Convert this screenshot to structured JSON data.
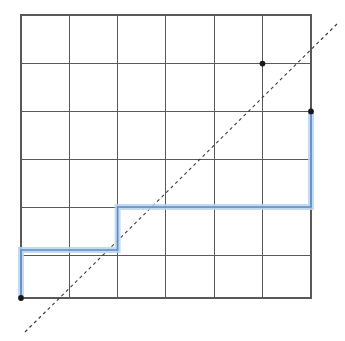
{
  "figure": {
    "type": "diagram",
    "width": 345,
    "height": 341,
    "background_color": "#ffffff"
  },
  "grid": {
    "label": "grid",
    "line_color": "#595959",
    "border_color": "#595959",
    "columns": 6,
    "rows": 6,
    "x_lines": [
      21,
      69.3,
      117.6,
      165.9,
      214.2,
      262.5,
      311
    ],
    "y_lines": [
      15,
      63,
      111,
      159,
      207,
      255,
      298
    ],
    "left": 21,
    "top": 15,
    "right": 311,
    "bottom": 298,
    "cell_width": 48.3,
    "cell_height": 48
  },
  "lattice_path": {
    "label": "staircase lattice path",
    "glow_color": "#b9d4ee",
    "stroke_color": "#5b8dc8",
    "start_point": [
      21,
      298
    ],
    "end_point": [
      311,
      111
    ],
    "points": [
      [
        21,
        298
      ],
      [
        21,
        250
      ],
      [
        117.6,
        250
      ],
      [
        117.6,
        207
      ],
      [
        311,
        207
      ],
      [
        311,
        111
      ]
    ],
    "segments": [
      {
        "name": "up-1",
        "from": [
          21,
          298
        ],
        "to": [
          21,
          250
        ],
        "direction": "up"
      },
      {
        "name": "right-1",
        "from": [
          21,
          250
        ],
        "to": [
          117.6,
          250
        ],
        "direction": "right"
      },
      {
        "name": "up-2",
        "from": [
          117.6,
          250
        ],
        "to": [
          117.6,
          207
        ],
        "direction": "up"
      },
      {
        "name": "right-2",
        "from": [
          117.6,
          207
        ],
        "to": [
          311,
          207
        ],
        "direction": "right"
      },
      {
        "name": "up-3",
        "from": [
          311,
          207
        ],
        "to": [
          311,
          111
        ],
        "direction": "up"
      }
    ]
  },
  "diagonal": {
    "label": "dashed diagonal reference line",
    "color": "#3a3a3a",
    "dash_pattern": "3.2 3.2",
    "from": [
      25,
      332
    ],
    "to": [
      339,
      22
    ]
  },
  "dots": [
    {
      "name": "dot-upper",
      "cx": 262.5,
      "cy": 63.6,
      "r": 2.9,
      "color": "#1a1a1a"
    },
    {
      "name": "dot-right",
      "cx": 311,
      "cy": 111.4,
      "r": 2.9,
      "color": "#1a1a1a"
    },
    {
      "name": "dot-origin",
      "cx": 21,
      "cy": 298,
      "r": 2.9,
      "color": "#1a1a1a"
    }
  ]
}
